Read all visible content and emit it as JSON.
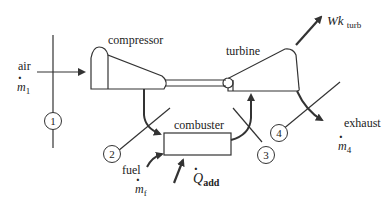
{
  "diagram": {
    "components": {
      "compressor": "compressor",
      "turbine": "turbine",
      "combuster": "combuster"
    },
    "flows": {
      "air_label": "air",
      "air_rate": "m",
      "air_rate_sub": "1",
      "fuel_label": "fuel",
      "fuel_rate": "m",
      "fuel_rate_sub": "f",
      "heat": "Q",
      "heat_sub": "add",
      "work": "Wk",
      "work_sub": "turb",
      "exhaust_label": "exhaust",
      "exhaust_rate": "m",
      "exhaust_rate_sub": "4"
    },
    "states": [
      "1",
      "2",
      "3",
      "4"
    ],
    "colors": {
      "line": "#333333",
      "text": "#222222",
      "background": "#ffffff"
    }
  }
}
